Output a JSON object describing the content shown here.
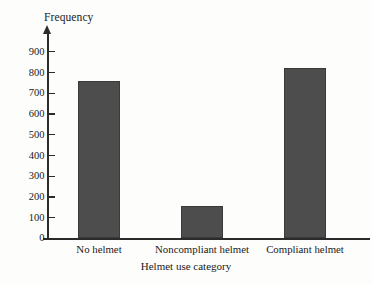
{
  "chart_data": {
    "type": "bar",
    "title": "",
    "subtitle": "",
    "xlabel": "Helmet use category",
    "ylabel": "Frequency",
    "categories": [
      "No helmet",
      "Noncompliant helmet",
      "Compliant helmet"
    ],
    "values": [
      755,
      155,
      820
    ],
    "series": [
      {
        "name": "Frequency",
        "values": [
          755,
          155,
          820
        ]
      }
    ],
    "ylim": [
      0,
      900
    ],
    "yticks": [
      0,
      100,
      200,
      300,
      400,
      500,
      600,
      700,
      800,
      900
    ],
    "ytick_labels": [
      "0",
      "100",
      "200",
      "300",
      "400",
      "500",
      "600",
      "700",
      "800",
      "900"
    ],
    "grid": false,
    "legend": false,
    "legend_position": "none",
    "bar_color": "#4d4d4d",
    "axis_color": "#2b2b2b",
    "background_color": "#fdfdfc"
  },
  "axes": {
    "y_axis_label": "Frequency",
    "x_axis_label": "Helmet use category"
  }
}
